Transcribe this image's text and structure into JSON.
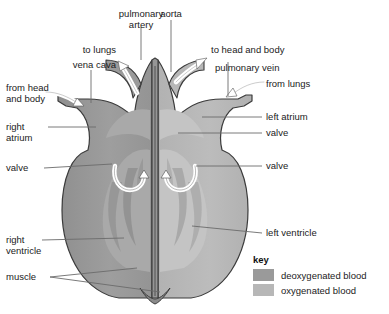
{
  "colors": {
    "deoxygenated": "#9a9a9a",
    "oxygenated": "#b7b7b7",
    "muscle_wall": "#8e8e8e",
    "outline": "#3b3b3b",
    "leader_line": "#6b6b6b",
    "text": "#1b1b1b",
    "arrow_fill": "#ffffff",
    "background": "#ffffff"
  },
  "labels": {
    "pulmonary_artery": "pulmonary\nartery",
    "aorta": "aorta",
    "to_lungs": "to lungs",
    "to_head_and_body": "to head and body",
    "vena_cava": "vena cava",
    "pulmonary_vein": "pulmonary vein",
    "from_head_and_body": "from head\nand body",
    "from_lungs": "from lungs",
    "right_atrium": "right\natrium",
    "left_atrium": "left atrium",
    "valve_left": "valve",
    "valve_right_upper": "valve",
    "valve_right_lower": "valve",
    "right_ventricle": "right\nventricle",
    "left_ventricle": "left ventricle",
    "muscle": "muscle"
  },
  "key": {
    "title": "key",
    "items": [
      {
        "label": "deoxygenated blood",
        "color": "#9a9a9a"
      },
      {
        "label": "oxygenated blood",
        "color": "#b7b7b7"
      }
    ]
  }
}
